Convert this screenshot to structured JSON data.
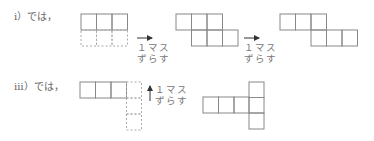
{
  "case1": {
    "label": "ⅰ）では，",
    "step1": {
      "note_line1": "１マス",
      "note_line2": "ずらす",
      "arrow": "right-arrow"
    },
    "step2": {
      "note_line1": "１マス",
      "note_line2": "ずらす",
      "arrow": "right-arrow"
    }
  },
  "case3": {
    "label": "ⅲ）では，",
    "step1": {
      "note_line1": "１マス",
      "note_line2": "ずらす",
      "arrow": "up-arrow"
    }
  },
  "colors": {
    "line": "#888888",
    "dashed": "#aaaaaa"
  }
}
